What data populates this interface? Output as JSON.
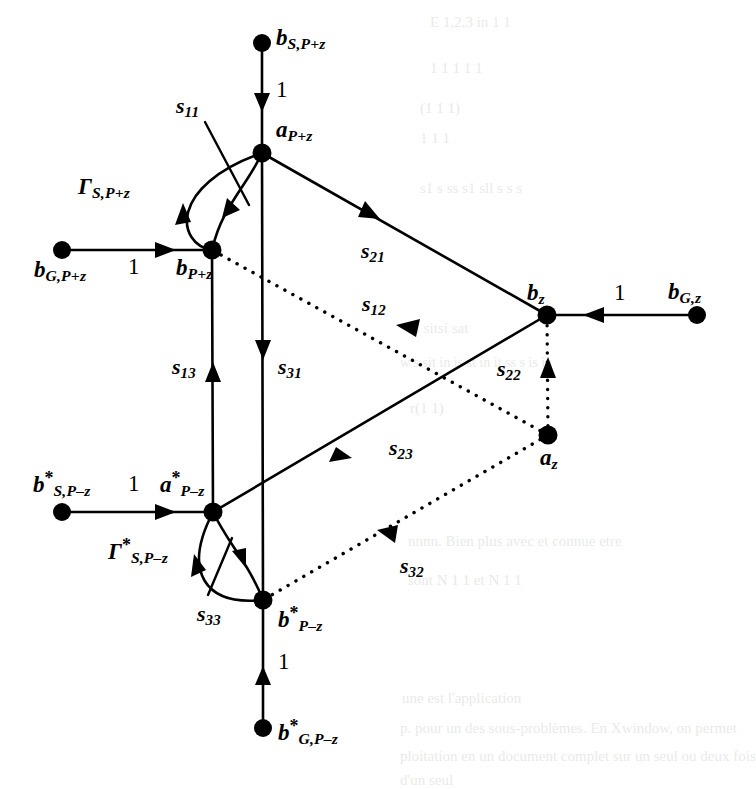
{
  "figure": {
    "type": "signal-flow-graph",
    "title": "",
    "colors": {
      "stroke": "#000000",
      "background": "#ffffff",
      "node_fill": "#000000"
    },
    "nodes": [
      {
        "id": "b_S_Pz",
        "label_html": "b<sub>S,P+z</sub>",
        "base": "b",
        "sub": "S,P+z",
        "star": false,
        "x": 262,
        "y": 43,
        "label_x": 276,
        "label_y": 26,
        "label_align": "left"
      },
      {
        "id": "a_Pz",
        "label_html": "a<sub>P+z</sub>",
        "base": "a",
        "sub": "P+z",
        "star": false,
        "x": 262,
        "y": 153,
        "label_x": 276,
        "label_y": 118,
        "label_align": "left"
      },
      {
        "id": "b_Pz",
        "label_html": "b<sub>P+z</sub>",
        "base": "b",
        "sub": "P+z",
        "star": false,
        "x": 212,
        "y": 250,
        "label_x": 176,
        "label_y": 256,
        "label_align": "left"
      },
      {
        "id": "b_G_Pz",
        "label_html": "b<sub>G,P+z</sub>",
        "base": "b",
        "sub": "G,P+z",
        "star": false,
        "x": 62,
        "y": 250,
        "label_x": 34,
        "label_y": 258,
        "label_align": "left"
      },
      {
        "id": "b_z",
        "label_html": "b<sub>z</sub>",
        "base": "b",
        "sub": "z",
        "star": false,
        "x": 547,
        "y": 315,
        "label_x": 527,
        "label_y": 281,
        "label_align": "left"
      },
      {
        "id": "b_G_z",
        "label_html": "b<sub>G,z</sub>",
        "base": "b",
        "sub": "G,z",
        "star": false,
        "x": 697,
        "y": 315,
        "label_x": 668,
        "label_y": 280,
        "label_align": "left"
      },
      {
        "id": "a_z",
        "label_html": "a<sub>z</sub>",
        "base": "a",
        "sub": "z",
        "star": false,
        "x": 548,
        "y": 435,
        "label_x": 540,
        "label_y": 446,
        "label_align": "left"
      },
      {
        "id": "a_Pmz",
        "label_html": "a*<sub>P-z</sub>",
        "base": "a",
        "sub": "P–z",
        "star": true,
        "x": 213,
        "y": 512,
        "label_x": 160,
        "label_y": 470,
        "label_align": "left"
      },
      {
        "id": "b_S_Pmz",
        "label_html": "b*<sub>S,P-z</sub>",
        "base": "b",
        "sub": "S,P–z",
        "star": true,
        "x": 62,
        "y": 512,
        "label_x": 33,
        "label_y": 470,
        "label_align": "left"
      },
      {
        "id": "b_Pmz",
        "label_html": "b*<sub>P-z</sub>",
        "base": "b",
        "sub": "P–z",
        "star": true,
        "x": 263,
        "y": 600,
        "label_x": 278,
        "label_y": 605,
        "label_align": "left"
      },
      {
        "id": "b_G_Pmz",
        "label_html": "b*<sub>G,P-z</sub>",
        "base": "b",
        "sub": "G,P–z",
        "star": true,
        "x": 263,
        "y": 728,
        "label_x": 278,
        "label_y": 718,
        "label_align": "left"
      }
    ],
    "edges": [
      {
        "id": "e_bS_to_a_Pz",
        "label": "1",
        "from": "b_S_Pz",
        "to": "a_Pz",
        "style": "solid",
        "arrow": "down",
        "label_x": 276,
        "label_y": 78
      },
      {
        "id": "e_bG_to_b_Pz",
        "label": "1",
        "from": "b_G_Pz",
        "to": "b_Pz",
        "style": "solid",
        "arrow": "right",
        "label_x": 128,
        "label_y": 255
      },
      {
        "id": "e_bGz_to_bz",
        "label": "1",
        "from": "b_G_z",
        "to": "b_z",
        "style": "solid",
        "arrow": "left",
        "label_x": 614,
        "label_y": 281
      },
      {
        "id": "e_bS_to_a_Pmz",
        "label": "1",
        "from": "b_S_Pmz",
        "to": "a_Pmz",
        "style": "solid",
        "arrow": "right",
        "label_x": 128,
        "label_y": 472
      },
      {
        "id": "e_bG_to_b_Pmz",
        "label": "1",
        "from": "b_G_Pmz",
        "to": "b_Pmz",
        "style": "solid",
        "arrow": "up",
        "label_x": 278,
        "label_y": 650
      },
      {
        "id": "e_s11",
        "label": "s11",
        "base": "s",
        "sub": "11",
        "from": "a_Pz",
        "to": "b_Pz",
        "style": "solid",
        "arrow": "down-left",
        "label_x": 176,
        "label_y": 95
      },
      {
        "id": "e_gamma_s_pz",
        "label": "GammaS,P+z",
        "from": "b_Pz",
        "to": "a_Pz",
        "style": "solid",
        "arrow": "up",
        "label_x": 78,
        "label_y": 175
      },
      {
        "id": "e_s21",
        "label": "s21",
        "base": "s",
        "sub": "21",
        "from": "a_Pz",
        "to": "b_z",
        "style": "solid",
        "arrow": "right",
        "label_x": 361,
        "label_y": 240
      },
      {
        "id": "e_s12",
        "label": "s12",
        "base": "s",
        "sub": "12",
        "from": "a_z",
        "to": "b_Pz",
        "style": "dotted",
        "arrow": "left",
        "label_x": 362,
        "label_y": 293
      },
      {
        "id": "e_s13",
        "label": "s13",
        "base": "s",
        "sub": "13",
        "from": "a_Pmz",
        "to": "b_Pz",
        "style": "solid",
        "arrow": "up",
        "label_x": 172,
        "label_y": 356
      },
      {
        "id": "e_s31",
        "label": "s31",
        "base": "s",
        "sub": "31",
        "from": "a_Pz",
        "to": "b_Pmz",
        "style": "solid",
        "arrow": "down",
        "label_x": 278,
        "label_y": 356
      },
      {
        "id": "e_s22",
        "label": "s22",
        "base": "s",
        "sub": "22",
        "from": "a_z",
        "to": "b_z",
        "style": "dotted",
        "arrow": "up",
        "label_x": 497,
        "label_y": 358
      },
      {
        "id": "e_s23",
        "label": "s23",
        "base": "s",
        "sub": "23",
        "from": "a_Pmz",
        "to": "b_z",
        "style": "solid",
        "arrow": "right",
        "label_x": 389,
        "label_y": 437
      },
      {
        "id": "e_s32",
        "label": "s32",
        "base": "s",
        "sub": "32",
        "from": "a_z",
        "to": "b_Pmz",
        "style": "dotted",
        "arrow": "left",
        "label_x": 400,
        "label_y": 555
      },
      {
        "id": "e_s33",
        "label": "s33",
        "base": "s",
        "sub": "33",
        "from": "a_Pmz",
        "to": "b_Pmz",
        "style": "solid",
        "arrow": "down-right",
        "label_x": 197,
        "label_y": 603
      },
      {
        "id": "e_gamma_s_pmz",
        "label": "Gamma*S,P-z",
        "from": "b_Pmz",
        "to": "a_Pmz",
        "style": "solid",
        "arrow": "up-left",
        "label_x": 108,
        "label_y": 537
      }
    ],
    "gain_labels": {
      "unity": "1"
    },
    "symbols": {
      "gamma": "Γ",
      "star": "*",
      "minus": "–",
      "plus": "+"
    }
  },
  "bleed_through": {
    "note": "faint mirrored text from reverse page",
    "lines": [
      {
        "text": "E 1,2,3 in 1 1",
        "x": 430,
        "y": 14,
        "size": 15
      },
      {
        "text": "1 1 1 1 1",
        "x": 430,
        "y": 60,
        "size": 15
      },
      {
        "text": "(1 1 1)",
        "x": 420,
        "y": 100,
        "size": 15
      },
      {
        "text": "1 1 1",
        "x": 420,
        "y": 130,
        "size": 15
      },
      {
        "text": "s1 s ss s1 sll s s s",
        "x": 420,
        "y": 180,
        "size": 15
      },
      {
        "text": "si sitsi sat",
        "x": 410,
        "y": 320,
        "size": 15
      },
      {
        "text": "w s sit in is st in it ss s is in",
        "x": 400,
        "y": 355,
        "size": 14
      },
      {
        "text": "r(1 1)",
        "x": 410,
        "y": 400,
        "size": 15
      },
      {
        "text": "nnnn. Bien plus avec et connue etre",
        "x": 408,
        "y": 533,
        "size": 15
      },
      {
        "text": "sont N          1 1 et  N  1 1 ",
        "x": 408,
        "y": 572,
        "size": 15
      },
      {
        "text": "une est l'application",
        "x": 402,
        "y": 690,
        "size": 15
      },
      {
        "text": "p. pour un des sous-problèmes. En Xwindow, on permet",
        "x": 400,
        "y": 720,
        "size": 15
      },
      {
        "text": "ploitation en un document complet sur un seul ou deux fois",
        "x": 400,
        "y": 748,
        "size": 15
      },
      {
        "text": "d'un seul",
        "x": 400,
        "y": 772,
        "size": 15
      }
    ]
  }
}
